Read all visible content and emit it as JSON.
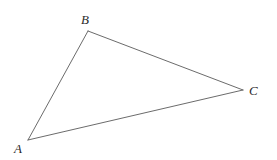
{
  "figure": {
    "kind": "geometry-diagram",
    "shape_name": "triangle",
    "background_color": "#ffffff",
    "stroke_color": "#5a5a5a",
    "label_color": "#2b2b2b",
    "canvas": {
      "width": 277,
      "height": 160
    },
    "vertices": [
      {
        "id": "A",
        "label": "A",
        "x": 28,
        "y": 140,
        "label_x": 14,
        "label_y": 153
      },
      {
        "id": "B",
        "label": "B",
        "x": 88,
        "y": 31,
        "label_x": 81,
        "label_y": 24
      },
      {
        "id": "C",
        "label": "C",
        "x": 243,
        "y": 90,
        "label_x": 249,
        "label_y": 95
      }
    ],
    "edges": [
      {
        "id": "AB",
        "from": "A",
        "to": "B",
        "x1": 28,
        "y1": 140,
        "x2": 88,
        "y2": 31
      },
      {
        "id": "BC",
        "from": "B",
        "to": "C",
        "x1": 88,
        "y1": 31,
        "x2": 243,
        "y2": 90
      },
      {
        "id": "CA",
        "from": "C",
        "to": "A",
        "x1": 243,
        "y1": 90,
        "x2": 28,
        "y2": 140
      }
    ]
  }
}
